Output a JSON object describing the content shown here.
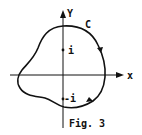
{
  "figure": {
    "caption": "Fig. 3",
    "curve_label": "C",
    "axes": {
      "x_label": "x",
      "y_label": "Y"
    },
    "points": [
      {
        "label": "i"
      },
      {
        "label": "-i"
      }
    ]
  }
}
